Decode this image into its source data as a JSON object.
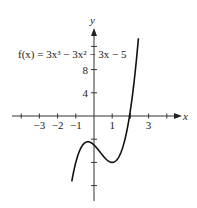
{
  "chart_data": {
    "type": "line",
    "title": "",
    "function_label": "f(x) = 3x³ − 3x² − 3x − 5",
    "xlabel": "x",
    "ylabel": "y",
    "x_ticks": [
      -3,
      -2,
      -1,
      1,
      3
    ],
    "x_tick_labels": [
      "−3",
      "−2",
      "−1",
      "1",
      "3"
    ],
    "y_ticks": [
      4,
      8
    ],
    "y_tick_labels": [
      "4",
      "8"
    ],
    "xlim": [
      -4,
      4.3
    ],
    "ylim": [
      -15,
      16
    ],
    "grid": false,
    "series": [
      {
        "name": "f(x) = 3x^3 - 3x^2 - 3x - 5",
        "x": [
          -1.2,
          -1.0,
          -0.8,
          -0.6,
          -0.333,
          0,
          0.4,
          0.8,
          1.0,
          1.3,
          1.6,
          2.0,
          2.2,
          2.4
        ],
        "y": [
          -10.9,
          -8.0,
          -6.0,
          -4.9,
          -4.4,
          -5.0,
          -6.5,
          -7.8,
          -8.0,
          -7.3,
          -4.7,
          1.0,
          5.3,
          11.5
        ]
      }
    ]
  }
}
